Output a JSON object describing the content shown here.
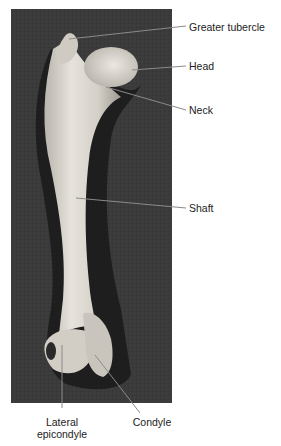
{
  "figure": {
    "colors": {
      "background": "#ffffff",
      "photo_background": "#3a3a3a",
      "bone": "#d9d6cf",
      "bone_shadow": "#141414",
      "leader_line": "#8a8a8a",
      "label_text": "#222222"
    },
    "labels": [
      {
        "id": "greater-tubercle",
        "text": "Greater tubercle",
        "x": 189,
        "y": 21
      },
      {
        "id": "head",
        "text": "Head",
        "x": 189,
        "y": 60
      },
      {
        "id": "neck",
        "text": "Neck",
        "x": 189,
        "y": 104
      },
      {
        "id": "shaft",
        "text": "Shaft",
        "x": 189,
        "y": 202
      },
      {
        "id": "lateral-epicondyle",
        "line1": "Lateral",
        "line2": "epicondyle",
        "x": 62,
        "y": 416
      },
      {
        "id": "condyle",
        "text": "Condyle",
        "x": 152,
        "y": 416
      }
    ]
  }
}
